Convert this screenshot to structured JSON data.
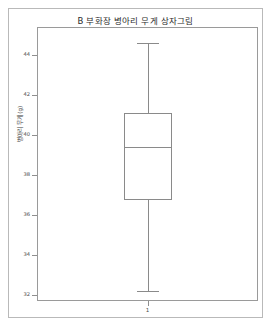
{
  "figure": {
    "title": "B 부화장 병아리 무게 상자그림",
    "y_axis_title": "병아리 무게 (g)",
    "x_tick_label": "1"
  },
  "axis": {
    "y_ticks": [
      "44",
      "42",
      "40",
      "38",
      "36",
      "34",
      "32"
    ]
  },
  "chart_data": {
    "type": "box",
    "title": "B 부화장 병아리 무게 상자그림",
    "xlabel": "",
    "ylabel": "병아리 무게 (g)",
    "ylim": [
      31.0,
      45.2
    ],
    "ytick_values": [
      44,
      42,
      40,
      38,
      36,
      34,
      32
    ],
    "grid": false,
    "legend": null,
    "categories": [
      "1"
    ],
    "boxes": [
      {
        "label": "1",
        "whisker_high": 44.6,
        "q3": 41.1,
        "median": 39.4,
        "q1": 36.75,
        "whisker_low": 32.2,
        "outliers": []
      }
    ]
  },
  "style": {
    "line_color": "#8a8a8a",
    "frame_color": "#9a9a9a",
    "text_color": "#2b2b2b",
    "background": "#ffffff"
  }
}
